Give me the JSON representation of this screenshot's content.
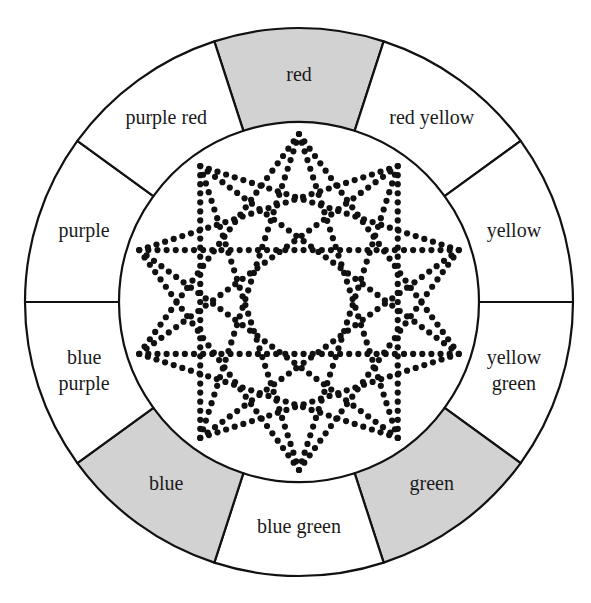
{
  "figure": {
    "name": "color-wheel",
    "geometry": {
      "center_x": 299,
      "center_y": 302,
      "outer_radius": 274,
      "inner_radius": 180,
      "segment_count": 10,
      "segment_angle_degrees": 36,
      "first_segment_center_angle_degrees": 0
    },
    "colors": {
      "stroke": "#111111",
      "shaded_fill": "#d2d2d2",
      "plain_fill": "#ffffff",
      "background": "#ffffff",
      "dot_color": "#111111"
    },
    "star": {
      "description": "two superimposed dotted star polygons inside the inner circle",
      "dot_radius": 3.1,
      "dot_spacing": 9.2,
      "polygons": [
        {
          "name": "star-polygon-a",
          "points": 10,
          "step": 3,
          "radius": 168,
          "rotation_degrees": 0
        },
        {
          "name": "star-polygon-b",
          "points": 10,
          "step": 4,
          "radius": 168,
          "rotation_degrees": 0
        }
      ]
    }
  },
  "segments": [
    {
      "id": "red",
      "label": "red",
      "lines": [
        "red"
      ],
      "shaded": true,
      "angle_center_degrees": 0,
      "label_radius": 226
    },
    {
      "id": "red-yellow",
      "label": "red yellow",
      "lines": [
        "red yellow"
      ],
      "shaded": false,
      "angle_center_degrees": 36,
      "label_radius": 226
    },
    {
      "id": "yellow",
      "label": "yellow",
      "lines": [
        "yellow"
      ],
      "shaded": false,
      "angle_center_degrees": 72,
      "label_radius": 226
    },
    {
      "id": "yellow-green",
      "label": "yellow green",
      "lines": [
        "yellow",
        "green"
      ],
      "shaded": false,
      "angle_center_degrees": 108,
      "label_radius": 226
    },
    {
      "id": "green",
      "label": "green",
      "lines": [
        "green"
      ],
      "shaded": true,
      "angle_center_degrees": 144,
      "label_radius": 226
    },
    {
      "id": "blue-green",
      "label": "blue green",
      "lines": [
        "blue green"
      ],
      "shaded": false,
      "angle_center_degrees": 180,
      "label_radius": 226
    },
    {
      "id": "blue",
      "label": "blue",
      "lines": [
        "blue"
      ],
      "shaded": true,
      "angle_center_degrees": 216,
      "label_radius": 226
    },
    {
      "id": "blue-purple",
      "label": "blue purple",
      "lines": [
        "blue",
        "purple"
      ],
      "shaded": false,
      "angle_center_degrees": 252,
      "label_radius": 226
    },
    {
      "id": "purple",
      "label": "purple",
      "lines": [
        "purple"
      ],
      "shaded": false,
      "angle_center_degrees": 288,
      "label_radius": 226
    },
    {
      "id": "purple-red",
      "label": "purple red",
      "lines": [
        "purple red"
      ],
      "shaded": false,
      "angle_center_degrees": 324,
      "label_radius": 226
    }
  ]
}
